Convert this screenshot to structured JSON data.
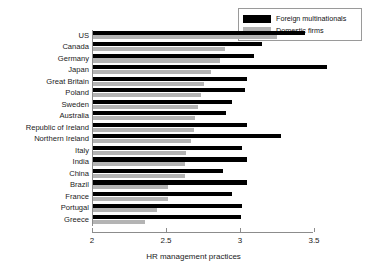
{
  "chart_data": {
    "type": "bar",
    "orientation": "horizontal",
    "title": "",
    "xlabel": "HR management practices",
    "ylabel": "",
    "xlim": [
      2,
      3.5
    ],
    "xticks": [
      2,
      2.5,
      3,
      3.5
    ],
    "xticklabels": [
      "2",
      "2.5",
      "3",
      "3.5"
    ],
    "grid": false,
    "legend_position": "top-right",
    "categories": [
      "US",
      "Canada",
      "Germany",
      "Japan",
      "Great Britain",
      "Poland",
      "Sweden",
      "Australia",
      "Republic of Ireland",
      "Northern Ireland",
      "Italy",
      "India",
      "China",
      "Brazil",
      "France",
      "Portugal",
      "Greece"
    ],
    "series": [
      {
        "name": "Foreign multinationals",
        "color": "#000000",
        "values": [
          3.43,
          3.14,
          3.09,
          3.58,
          3.04,
          3.03,
          2.94,
          2.9,
          3.04,
          3.27,
          3.01,
          3.04,
          2.88,
          3.04,
          2.94,
          3.01,
          3.0
        ]
      },
      {
        "name": "Domestic firms",
        "color": "#b4b4b4",
        "values": [
          3.24,
          2.89,
          2.86,
          2.8,
          2.75,
          2.73,
          2.71,
          2.69,
          2.68,
          2.66,
          2.63,
          2.62,
          2.62,
          2.51,
          2.51,
          2.43,
          2.35
        ]
      }
    ]
  },
  "legend": {
    "items": [
      {
        "label": "Foreign multinationals",
        "color": "#000000"
      },
      {
        "label": "Domestic firms",
        "color": "#b4b4b4"
      }
    ]
  }
}
